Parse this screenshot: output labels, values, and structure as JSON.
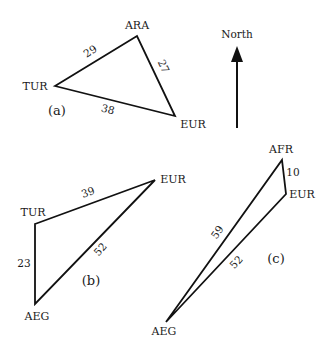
{
  "north_arrow": {
    "label": "North",
    "x": 237,
    "y_tail": 128,
    "y_head": 46
  },
  "diagrams": [
    {
      "panel_label": "(a)",
      "panel_pos": [
        57,
        115
      ],
      "vertices": [
        {
          "name": "TUR",
          "x": 55,
          "y": 86,
          "label_x": 35,
          "label_y": 90,
          "anchor": "middle"
        },
        {
          "name": "ARA",
          "x": 137,
          "y": 36,
          "label_x": 137,
          "label_y": 29,
          "anchor": "middle"
        },
        {
          "name": "EUR",
          "x": 175,
          "y": 116,
          "label_x": 193,
          "label_y": 128,
          "anchor": "middle"
        }
      ],
      "edges": [
        {
          "from": "TUR",
          "to": "ARA",
          "length": "29",
          "label_x": 90,
          "label_y": 55,
          "rotate": -33
        },
        {
          "from": "ARA",
          "to": "EUR",
          "length": "27",
          "label_x": 164,
          "label_y": 70,
          "rotate": 65
        },
        {
          "from": "TUR",
          "to": "EUR",
          "length": "38",
          "label_x": 108,
          "label_y": 113,
          "rotate": 15
        }
      ]
    },
    {
      "panel_label": "(b)",
      "panel_pos": [
        91,
        285
      ],
      "vertices": [
        {
          "name": "TUR",
          "x": 35,
          "y": 224,
          "label_x": 33,
          "label_y": 216,
          "anchor": "middle"
        },
        {
          "name": "EUR",
          "x": 155,
          "y": 180,
          "label_x": 173,
          "label_y": 183,
          "anchor": "middle"
        },
        {
          "name": "AEG",
          "x": 35,
          "y": 304,
          "label_x": 37,
          "label_y": 320,
          "anchor": "middle"
        }
      ],
      "edges": [
        {
          "from": "TUR",
          "to": "EUR",
          "length": "39",
          "label_x": 88,
          "label_y": 196,
          "rotate": -20
        },
        {
          "from": "TUR",
          "to": "AEG",
          "length": "23",
          "label_x": 24,
          "label_y": 267,
          "rotate": 0
        },
        {
          "from": "EUR",
          "to": "AEG",
          "length": "52",
          "label_x": 100,
          "label_y": 253,
          "rotate": -48
        }
      ]
    },
    {
      "panel_label": "(c)",
      "panel_pos": [
        276,
        263
      ],
      "vertices": [
        {
          "name": "AFR",
          "x": 282,
          "y": 160,
          "label_x": 281,
          "label_y": 153,
          "anchor": "middle"
        },
        {
          "name": "EUR",
          "x": 286,
          "y": 194,
          "label_x": 302,
          "label_y": 198,
          "anchor": "middle"
        },
        {
          "name": "AEG",
          "x": 166,
          "y": 322,
          "label_x": 164,
          "label_y": 335,
          "anchor": "middle"
        }
      ],
      "edges": [
        {
          "from": "AFR",
          "to": "EUR",
          "length": "10",
          "label_x": 293,
          "label_y": 176,
          "rotate": 0
        },
        {
          "from": "AFR",
          "to": "AEG",
          "length": "59",
          "label_x": 217,
          "label_y": 236,
          "rotate": -55
        },
        {
          "from": "EUR",
          "to": "AEG",
          "length": "52",
          "label_x": 236,
          "label_y": 266,
          "rotate": -47
        }
      ]
    }
  ]
}
